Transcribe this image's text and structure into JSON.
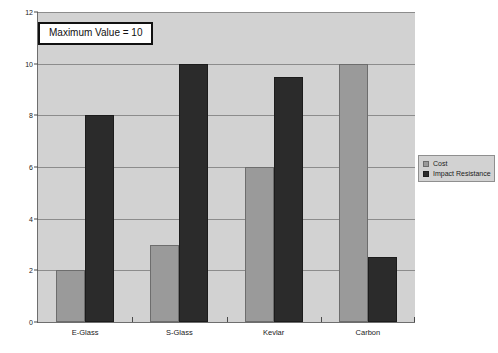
{
  "chart_data": {
    "type": "bar",
    "title": "",
    "subtitle": "",
    "xlabel": "",
    "ylabel": "",
    "categories": [
      "E-Glass",
      "S-Glass",
      "Kevlar",
      "Carbon"
    ],
    "series": [
      {
        "name": "Cost",
        "values": [
          2,
          3,
          6,
          10
        ],
        "color": "#9a9a9a"
      },
      {
        "name": "Impact Resistance",
        "values": [
          8,
          10,
          9.5,
          2.5
        ],
        "color": "#2b2b2b"
      }
    ],
    "ylim": [
      0,
      12
    ],
    "ytick_labels": [
      "0",
      "2",
      "4",
      "6",
      "8",
      "10",
      "12"
    ],
    "ytick_values": [
      0,
      2,
      4,
      6,
      8,
      10,
      12
    ],
    "grid": true,
    "legend_position": "right",
    "annotations": [
      {
        "text": "Maximum Value = 10"
      }
    ],
    "plot_background": "#d2d2d2",
    "figure_background": "#ffffff"
  },
  "legend": {
    "entries": [
      {
        "label": "Cost"
      },
      {
        "label": "Impact Resistance"
      }
    ]
  },
  "annotation": {
    "label": "Maximum Value = 10"
  }
}
